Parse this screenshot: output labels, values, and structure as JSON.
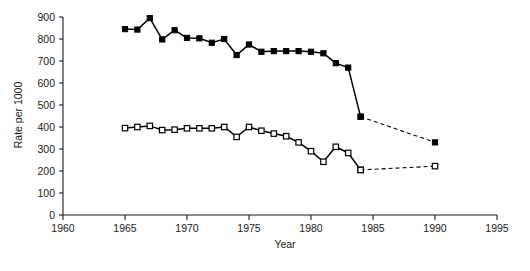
{
  "chart_data": {
    "type": "line",
    "title": "",
    "xlabel": "Year",
    "ylabel": "Rate per 1000",
    "xlim": [
      1960,
      1995
    ],
    "ylim": [
      0,
      900
    ],
    "xticks": [
      1960,
      1965,
      1970,
      1975,
      1980,
      1985,
      1990,
      1995
    ],
    "yticks": [
      0,
      100,
      200,
      300,
      400,
      500,
      600,
      700,
      800,
      900
    ],
    "xtick_labels": [
      "1960",
      "1965",
      "1970",
      "1975",
      "1980",
      "1985",
      "1990",
      "1995"
    ],
    "ytick_labels": [
      "0",
      "100",
      "200",
      "300",
      "400",
      "500",
      "600",
      "700",
      "800",
      "900"
    ],
    "grid": false,
    "legend": "none",
    "series": [
      {
        "name": "filled-square-series",
        "marker": "filled-square",
        "linestyle": "solid",
        "color": "#000000",
        "x": [
          1965,
          1966,
          1967,
          1968,
          1969,
          1970,
          1971,
          1972,
          1973,
          1974,
          1975,
          1976,
          1977,
          1978,
          1979,
          1980,
          1981,
          1982,
          1983,
          1984
        ],
        "values": [
          845,
          843,
          895,
          798,
          840,
          805,
          803,
          783,
          800,
          727,
          775,
          742,
          745,
          745,
          745,
          742,
          735,
          690,
          670,
          447
        ]
      },
      {
        "name": "filled-square-projection",
        "marker": "filled-square",
        "linestyle": "dashed",
        "color": "#000000",
        "x": [
          1984,
          1990
        ],
        "values": [
          447,
          330
        ]
      },
      {
        "name": "open-square-series",
        "marker": "open-square",
        "linestyle": "solid",
        "color": "#000000",
        "x": [
          1965,
          1966,
          1967,
          1968,
          1969,
          1970,
          1971,
          1972,
          1973,
          1974,
          1975,
          1976,
          1977,
          1978,
          1979,
          1980,
          1981,
          1982,
          1983,
          1984
        ],
        "values": [
          395,
          400,
          405,
          386,
          388,
          394,
          394,
          394,
          400,
          355,
          400,
          383,
          370,
          358,
          330,
          290,
          242,
          310,
          282,
          205
        ]
      },
      {
        "name": "open-square-projection",
        "marker": "open-square",
        "linestyle": "dashed",
        "color": "#000000",
        "x": [
          1984,
          1990
        ],
        "values": [
          205,
          222
        ]
      }
    ]
  },
  "axes": {
    "x_axis_title": "Year",
    "y_axis_title": "Rate per 1000"
  }
}
